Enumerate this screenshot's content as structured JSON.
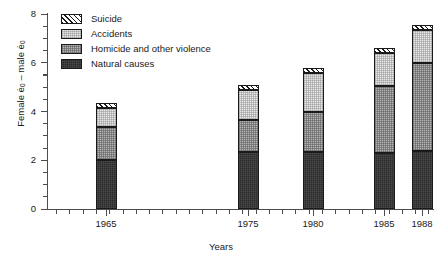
{
  "chart_data": {
    "type": "bar",
    "subtype": "stacked-vertical",
    "title": "",
    "xlabel": "Years",
    "ylabel": "Female ë0 – male ë0",
    "ylabel_parts": {
      "prefix": "Female ",
      "e1": "ė",
      "sub1": "0",
      "middle": " – male ",
      "e2": "ė",
      "sub2": "0"
    },
    "categories": [
      "1965",
      "1975",
      "1980",
      "1985",
      "1988"
    ],
    "ylim": [
      0,
      8
    ],
    "yticks": [
      0,
      2,
      4,
      6,
      8
    ],
    "ytick_labels": [
      "0",
      "2",
      "4",
      "6",
      "8"
    ],
    "ytick_minor_step": 0.5,
    "xtick_minor": true,
    "grid": false,
    "legend_position": "top-left-inside",
    "series": [
      {
        "name": "Natural causes",
        "key": "natural",
        "fill": "solid-black",
        "color": "#2b2b2b",
        "values": [
          2.0,
          2.35,
          2.35,
          2.3,
          2.4
        ]
      },
      {
        "name": "Homicide and other violence",
        "key": "homicide",
        "fill": "mid-gray",
        "color": "#b6b6b6",
        "values": [
          1.35,
          1.3,
          1.65,
          2.75,
          3.6
        ]
      },
      {
        "name": "Accidents",
        "key": "accidents",
        "fill": "light-gray",
        "color": "#e8e8e8",
        "values": [
          0.8,
          1.25,
          1.6,
          1.35,
          1.35
        ]
      },
      {
        "name": "Suicide",
        "key": "suicide",
        "fill": "diagonal-hatch",
        "color": "#ffffff",
        "values": [
          0.2,
          0.2,
          0.2,
          0.2,
          0.2
        ]
      }
    ],
    "totals": [
      4.35,
      5.1,
      5.8,
      6.6,
      7.55
    ]
  },
  "legend": {
    "items": [
      {
        "label": "Suicide",
        "key": "suicide"
      },
      {
        "label": "Accidents",
        "key": "accidents"
      },
      {
        "label": "Homicide and other violence",
        "key": "homicide"
      },
      {
        "label": "Natural causes",
        "key": "natural"
      }
    ]
  }
}
